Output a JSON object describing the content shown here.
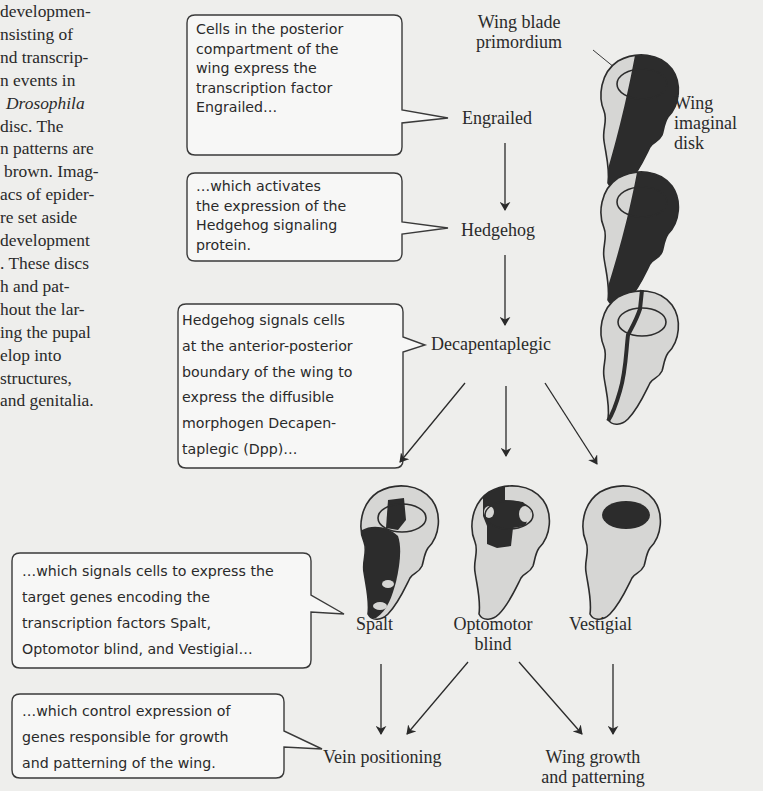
{
  "body_text": {
    "lines": [
      "developmen-",
      "nsisting of",
      "nd transcrip-",
      "n events in",
      "",
      "disc. The",
      "n patterns are",
      "brown. Imag-",
      "acs of epider-",
      "re set aside",
      "development",
      ". These discs",
      "h and pat-",
      "hout the lar-",
      "ing the pupal",
      "elop into",
      "structures,",
      "and genitalia."
    ],
    "italic_line": "Drosophila"
  },
  "callouts": [
    {
      "id": "engrailed",
      "lines": [
        "Cells in the posterior",
        "compartment of the",
        "wing express the",
        "transcription factor",
        "Engrailed…"
      ]
    },
    {
      "id": "hedgehog",
      "lines": [
        "…which activates",
        "the expression of the",
        "Hedgehog signaling",
        "protein."
      ]
    },
    {
      "id": "dpp",
      "lines": [
        "Hedgehog signals cells",
        "at the anterior-posterior",
        "boundary of the wing to",
        "express the diffusible",
        "morphogen Decapen-",
        "taplegic (Dpp)…"
      ]
    },
    {
      "id": "targets",
      "lines": [
        "…which signals cells to express the",
        "target genes encoding the",
        "transcription factors Spalt,",
        "Optomotor blind, and Vestigial…"
      ]
    },
    {
      "id": "outcomes",
      "lines": [
        "…which control expression of",
        "genes responsible for growth",
        "and patterning of the wing."
      ]
    }
  ],
  "nodes": {
    "engrailed": "Engrailed",
    "hedgehog": "Hedgehog",
    "decapentaplegic": "Decapentaplegic",
    "spalt": "Spalt",
    "optomotor_line1": "Optomotor",
    "optomotor_line2": "blind",
    "vestigial": "Vestigial",
    "vein_positioning": "Vein positioning",
    "wing_growth_line1": "Wing growth",
    "wing_growth_line2": "and patterning"
  },
  "annotations": {
    "wing_blade_line1": "Wing blade",
    "wing_blade_line2": "primordium",
    "imaginal_line1": "Wing",
    "imaginal_line2": "imaginal",
    "imaginal_line3": "disk"
  },
  "colors": {
    "background": "#eeeeec",
    "disc_fill": "#d6d6d4",
    "expression": "#2c2c2c",
    "callout_fill": "#f7f7f6",
    "stroke": "#3a3a3a"
  }
}
